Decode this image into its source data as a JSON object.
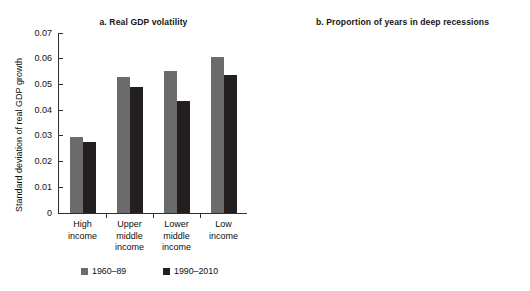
{
  "figure": {
    "caption_remnant": "",
    "legend": [
      {
        "label": "1960–89",
        "color": "#6b6b6b",
        "swatch_name": "legend-swatch-1960-89"
      },
      {
        "label": "1990–2010",
        "color": "#231f20",
        "swatch_name": "legend-swatch-1990-2010"
      }
    ]
  },
  "chart_data": [
    {
      "type": "bar",
      "panel": "a",
      "title": "a.  Real GDP volatility",
      "xlabel": "",
      "ylabel": "Standard deviation of real GDP growth",
      "categories": [
        "High income",
        "Upper middle income",
        "Lower middle income",
        "Low income"
      ],
      "category_lines": [
        [
          "High",
          "income"
        ],
        [
          "Upper",
          "middle",
          "income"
        ],
        [
          "Lower",
          "middle",
          "income"
        ],
        [
          "Low",
          "income"
        ]
      ],
      "ylim": [
        0,
        0.07
      ],
      "yticks": [
        0,
        0.01,
        0.02,
        0.03,
        0.04,
        0.05,
        0.06,
        0.07
      ],
      "ytick_labels": [
        "0",
        "0.01",
        "0.02",
        "0.03",
        "0.04",
        "0.05",
        "0.06",
        "0.07"
      ],
      "grid": false,
      "legend_position": "below",
      "series": [
        {
          "name": "1960–89",
          "color": "#6b6b6b",
          "values": [
            0.0296,
            0.0529,
            0.0552,
            0.0607
          ]
        },
        {
          "name": "1990–2010",
          "color": "#231f20",
          "values": [
            0.0276,
            0.0491,
            0.0436,
            0.0537
          ]
        }
      ]
    },
    {
      "type": "bar",
      "panel": "b",
      "title": "b.  Proportion of years in deep recessions",
      "xlabel": "",
      "ylabel": "Proportion of years in period",
      "categories": [
        "High income",
        "Upper middle income",
        "Lower middle income",
        "Low income"
      ],
      "category_lines": [
        [
          "High",
          "income"
        ],
        [
          "Upper",
          "middle",
          "income"
        ],
        [
          "Lower",
          "middle",
          "income"
        ],
        [
          "Low",
          "income"
        ]
      ],
      "ylim": [
        0,
        0.45
      ],
      "yticks": [
        0,
        0.05,
        0.1,
        0.15,
        0.2,
        0.25,
        0.3,
        0.35,
        0.4,
        0.45
      ],
      "ytick_labels": [
        "0",
        "0.05",
        "0.10",
        "0.15",
        "0.20",
        "0.25",
        "0.30",
        "0.35",
        "0.40",
        "0.45"
      ],
      "grid": false,
      "legend_position": "below",
      "series": [
        {
          "name": "1960–89",
          "color": "#6b6b6b",
          "values": [
            0.0625,
            0.21,
            0.2525,
            0.39
          ]
        },
        {
          "name": "1990–2010",
          "color": "#231f20",
          "values": [
            0.0775,
            0.0775,
            0.0525,
            0.14
          ]
        }
      ]
    }
  ]
}
